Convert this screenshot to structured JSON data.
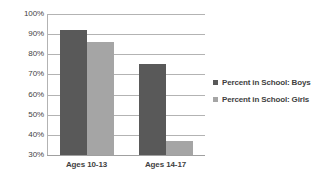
{
  "chart_data": {
    "type": "bar",
    "title": "",
    "subtitle": "",
    "xlabel": "",
    "ylabel": "",
    "categories": [
      "Ages 10-13",
      "Ages 14-17"
    ],
    "series": [
      {
        "name": "Percent in School: Boys",
        "values": [
          92,
          75
        ],
        "color": "#595959"
      },
      {
        "name": "Percent in School: Girls",
        "values": [
          86,
          37
        ],
        "color": "#a5a5a5"
      }
    ],
    "ylim": [
      30,
      100
    ],
    "ytick_values": [
      100,
      90,
      80,
      70,
      60,
      50,
      40,
      30
    ],
    "ytick_labels": [
      "100%",
      "90%",
      "80%",
      "70%",
      "60%",
      "50%",
      "40%",
      "30%"
    ],
    "grid": true,
    "grid_color": "#b3b3b3",
    "legend_position": "right",
    "value_suffix": "%"
  },
  "legend": {
    "items": [
      {
        "label": "Percent in School: Boys",
        "swatch": "boys"
      },
      {
        "label": "Percent in School: Girls",
        "swatch": "girls"
      }
    ]
  }
}
